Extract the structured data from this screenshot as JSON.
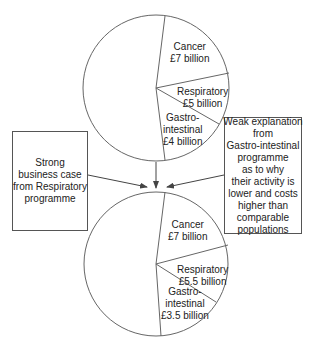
{
  "diagram": {
    "top_pie": {
      "slices": [
        {
          "name": "Cancer",
          "value_label": "£7 billion"
        },
        {
          "name": "Respiratory",
          "value_label": "£5 billion"
        },
        {
          "name": "Gastro-intestinal",
          "name_lines": [
            "Gastro-",
            "intestinal"
          ],
          "value_label": "£4 billion"
        }
      ]
    },
    "bottom_pie": {
      "slices": [
        {
          "name": "Cancer",
          "value_label": "£7 billion"
        },
        {
          "name": "Respiratory",
          "value_label": "£5.5 billion"
        },
        {
          "name": "Gastro-intestinal",
          "name_lines": [
            "Gastro-",
            "intestinal"
          ],
          "value_label": "£3.5 billion"
        }
      ]
    },
    "left_box": {
      "lines": [
        "Strong",
        "business case",
        "from Respiratory",
        "programme"
      ]
    },
    "right_box": {
      "lines": [
        "Weak explanation",
        "from",
        "Gastro-intestinal",
        "programme",
        "as to why",
        "their activity is",
        "lower and costs",
        "higher than",
        "comparable",
        "populations"
      ]
    },
    "colors": {
      "stroke": "#555555",
      "text": "#222222",
      "background": "#ffffff"
    }
  }
}
